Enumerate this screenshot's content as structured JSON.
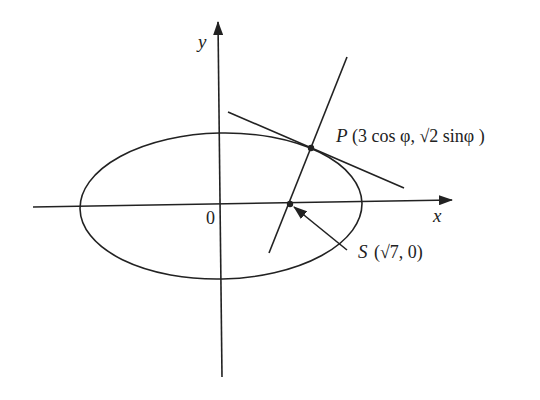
{
  "diagram": {
    "labels": {
      "y_axis": "y",
      "x_axis": "x",
      "origin": "0",
      "point_p": "P",
      "point_p_coords": "(3 cos φ,  √2 sinφ )",
      "point_s": "S",
      "point_s_coords": "(√7, 0)"
    },
    "ellipse": {
      "a": 3,
      "b_expr": "√2"
    },
    "points": {
      "P": {
        "x_expr": "3 cos φ",
        "y_expr": "√2 sin φ"
      },
      "S": {
        "x_expr": "√7",
        "y_expr": "0"
      }
    },
    "elements": [
      "x-axis",
      "y-axis",
      "ellipse",
      "tangent-at-P",
      "normal-at-P",
      "pointer-arrow-to-S"
    ]
  }
}
